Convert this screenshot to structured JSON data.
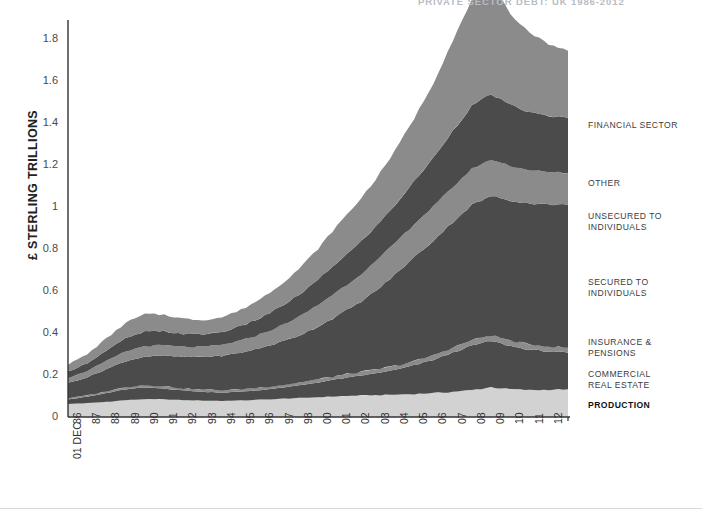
{
  "page": {
    "top_headline": "PRIVATE SECTOR DEBT: UK 1986-2012"
  },
  "axes": {
    "y_title": "£ STERLING TRILLIONS",
    "y_ticks": [
      "1.8",
      "1.6",
      "1.4",
      "1.2",
      "1",
      "0.8",
      "0.6",
      "0.4",
      "0.2",
      "0"
    ],
    "y_tick_values": [
      1.8,
      1.6,
      1.4,
      1.2,
      1.0,
      0.8,
      0.6,
      0.4,
      0.2,
      0
    ],
    "x_ticks": [
      "86",
      "87",
      "88",
      "89",
      "90",
      "91",
      "92",
      "93",
      "94",
      "95",
      "96",
      "97",
      "98",
      "00",
      "01",
      "02",
      "03",
      "04",
      "05",
      "06",
      "07",
      "08",
      "09",
      "10",
      "11",
      "12"
    ],
    "x_sub_label": "01 DEC"
  },
  "legend": [
    {
      "label": "FINANCIAL SECTOR",
      "color": "#8b8b8b",
      "bold": false,
      "top": 120
    },
    {
      "label": "OTHER",
      "color": "#4b4b4b",
      "bold": false,
      "top": 178
    },
    {
      "label": "UNSECURED TO\nINDIVIDUALS",
      "color": "#8b8b8b",
      "bold": false,
      "top": 211
    },
    {
      "label": "SECURED TO\nINDIVIDUALS",
      "color": "#4b4b4b",
      "bold": false,
      "top": 277
    },
    {
      "label": "INSURANCE &\nPENSIONS",
      "color": "#8b8b8b",
      "bold": false,
      "top": 337
    },
    {
      "label": "COMMERCIAL\nREAL ESTATE",
      "color": "#4b4b4b",
      "bold": false,
      "top": 369
    },
    {
      "label": "PRODUCTION",
      "color": "#d2d2d2",
      "bold": true,
      "top": 400
    }
  ],
  "colors": {
    "band_light": "#d2d2d2",
    "band_mid": "#8b8b8b",
    "band_dark": "#4b4b4b",
    "axis": "#333333",
    "text": "#3a3a3a"
  },
  "chart_data": {
    "type": "area",
    "stacked": true,
    "title": "PRIVATE SECTOR DEBT: UK 1986-2012",
    "xlabel": "",
    "ylabel": "£ STERLING TRILLIONS",
    "ylim": [
      0,
      1.9
    ],
    "grid": false,
    "legend_position": "right",
    "x": [
      1986,
      1987,
      1988,
      1989,
      1990,
      1991,
      1992,
      1993,
      1994,
      1995,
      1996,
      1997,
      1998,
      1999,
      2000,
      2001,
      2002,
      2003,
      2004,
      2005,
      2006,
      2007,
      2008,
      2009,
      2010,
      2011,
      2012
    ],
    "x_tick_labels": [
      "86",
      "87",
      "88",
      "89",
      "90",
      "91",
      "92",
      "93",
      "94",
      "95",
      "96",
      "97",
      "98",
      "00",
      "01",
      "02",
      "03",
      "04",
      "05",
      "06",
      "07",
      "08",
      "09",
      "10",
      "11",
      "12"
    ],
    "series": [
      {
        "name": "PRODUCTION",
        "color": "#d2d2d2",
        "values": [
          0.062,
          0.066,
          0.072,
          0.08,
          0.085,
          0.084,
          0.08,
          0.078,
          0.077,
          0.079,
          0.082,
          0.086,
          0.09,
          0.094,
          0.098,
          0.102,
          0.104,
          0.106,
          0.11,
          0.114,
          0.12,
          0.128,
          0.142,
          0.132,
          0.128,
          0.13,
          0.132
        ]
      },
      {
        "name": "COMMERCIAL REAL ESTATE",
        "color": "#4b4b4b",
        "values": [
          0.022,
          0.03,
          0.042,
          0.052,
          0.056,
          0.052,
          0.046,
          0.042,
          0.04,
          0.042,
          0.046,
          0.052,
          0.06,
          0.07,
          0.082,
          0.092,
          0.104,
          0.118,
          0.136,
          0.158,
          0.186,
          0.212,
          0.22,
          0.206,
          0.192,
          0.182,
          0.174
        ]
      },
      {
        "name": "INSURANCE & PENSIONS",
        "color": "#8b8b8b",
        "values": [
          0.006,
          0.007,
          0.008,
          0.01,
          0.011,
          0.011,
          0.01,
          0.01,
          0.01,
          0.011,
          0.012,
          0.013,
          0.014,
          0.015,
          0.016,
          0.017,
          0.018,
          0.019,
          0.02,
          0.022,
          0.024,
          0.026,
          0.028,
          0.026,
          0.025,
          0.024,
          0.024
        ]
      },
      {
        "name": "SECURED TO INDIVIDUALS",
        "color": "#4b4b4b",
        "values": [
          0.072,
          0.086,
          0.106,
          0.124,
          0.136,
          0.144,
          0.15,
          0.156,
          0.164,
          0.174,
          0.188,
          0.204,
          0.224,
          0.252,
          0.286,
          0.324,
          0.374,
          0.434,
          0.494,
          0.546,
          0.598,
          0.644,
          0.662,
          0.668,
          0.672,
          0.676,
          0.68
        ]
      },
      {
        "name": "UNSECURED TO INDIVIDUALS",
        "color": "#8b8b8b",
        "values": [
          0.024,
          0.03,
          0.038,
          0.046,
          0.05,
          0.05,
          0.048,
          0.048,
          0.052,
          0.058,
          0.066,
          0.076,
          0.088,
          0.102,
          0.116,
          0.128,
          0.14,
          0.15,
          0.158,
          0.162,
          0.166,
          0.172,
          0.174,
          0.164,
          0.158,
          0.154,
          0.152
        ]
      },
      {
        "name": "OTHER",
        "color": "#4b4b4b",
        "values": [
          0.03,
          0.038,
          0.05,
          0.062,
          0.068,
          0.066,
          0.062,
          0.06,
          0.062,
          0.068,
          0.078,
          0.09,
          0.104,
          0.12,
          0.138,
          0.152,
          0.166,
          0.182,
          0.204,
          0.232,
          0.268,
          0.3,
          0.312,
          0.29,
          0.276,
          0.268,
          0.262
        ]
      },
      {
        "name": "FINANCIAL SECTOR",
        "color": "#8b8b8b",
        "values": [
          0.034,
          0.042,
          0.058,
          0.074,
          0.084,
          0.08,
          0.072,
          0.068,
          0.07,
          0.078,
          0.09,
          0.106,
          0.124,
          0.148,
          0.176,
          0.2,
          0.226,
          0.258,
          0.3,
          0.356,
          0.43,
          0.502,
          0.53,
          0.434,
          0.38,
          0.342,
          0.32
        ]
      }
    ]
  }
}
